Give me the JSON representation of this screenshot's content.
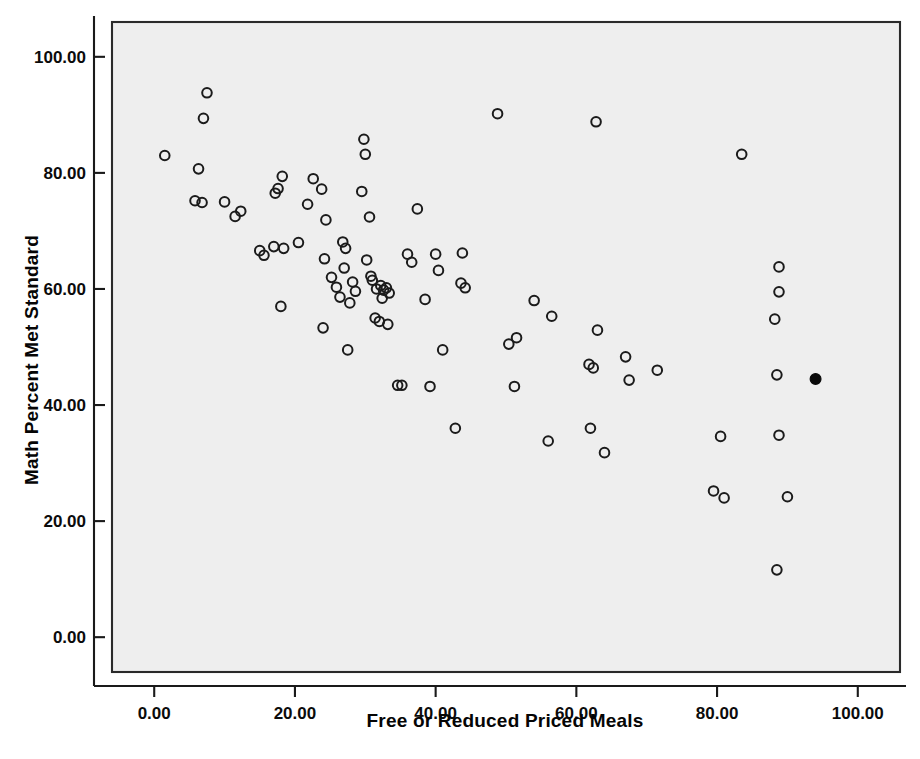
{
  "chart_data": {
    "type": "scatter",
    "title": "",
    "xlabel": "Free or Reduced Priced Meals",
    "ylabel": "Math Percent Met Standard",
    "xlim": [
      -6,
      106
    ],
    "ylim": [
      -6,
      106
    ],
    "xticks": [
      0,
      20,
      40,
      60,
      80,
      100
    ],
    "yticks": [
      0,
      20,
      40,
      60,
      80,
      100
    ],
    "xticklabels": [
      "0.00",
      "20.00",
      "40.00",
      "60.00",
      "80.00",
      "100.00"
    ],
    "yticklabels": [
      "0.00",
      "20.00",
      "40.00",
      "60.00",
      "80.00",
      "100.00"
    ],
    "grid": false,
    "legend": null,
    "marker": "circle-open",
    "marker_size": 9,
    "plot_background": "#eeeeee",
    "marker_color": "#1b1b1b",
    "highlight_color": "#0a0a0a",
    "series": [
      {
        "name": "Schools",
        "marker_style": "open",
        "points": [
          [
            1.5,
            83.0
          ],
          [
            7.5,
            93.8
          ],
          [
            7.0,
            89.4
          ],
          [
            6.3,
            80.7
          ],
          [
            5.8,
            75.2
          ],
          [
            6.8,
            74.9
          ],
          [
            10.0,
            75.0
          ],
          [
            11.5,
            72.5
          ],
          [
            12.3,
            73.4
          ],
          [
            15.0,
            66.6
          ],
          [
            15.6,
            65.8
          ],
          [
            17.2,
            76.5
          ],
          [
            17.6,
            77.3
          ],
          [
            18.2,
            79.4
          ],
          [
            17.0,
            67.3
          ],
          [
            18.4,
            67.0
          ],
          [
            18.0,
            57.0
          ],
          [
            20.5,
            68.0
          ],
          [
            21.8,
            74.6
          ],
          [
            22.6,
            79.0
          ],
          [
            23.8,
            77.2
          ],
          [
            24.4,
            71.9
          ],
          [
            24.2,
            65.2
          ],
          [
            24.0,
            53.3
          ],
          [
            25.2,
            62.0
          ],
          [
            25.9,
            60.3
          ],
          [
            26.4,
            58.6
          ],
          [
            26.8,
            68.1
          ],
          [
            27.2,
            67.0
          ],
          [
            27.0,
            63.6
          ],
          [
            27.8,
            57.6
          ],
          [
            28.2,
            61.2
          ],
          [
            28.6,
            59.6
          ],
          [
            27.5,
            49.5
          ],
          [
            29.5,
            76.8
          ],
          [
            29.8,
            85.8
          ],
          [
            30.0,
            83.2
          ],
          [
            30.6,
            72.4
          ],
          [
            30.2,
            65.0
          ],
          [
            30.8,
            62.2
          ],
          [
            31.0,
            61.5
          ],
          [
            31.6,
            60.0
          ],
          [
            31.4,
            55.0
          ],
          [
            32.2,
            60.6
          ],
          [
            32.6,
            59.8
          ],
          [
            32.4,
            58.4
          ],
          [
            33.0,
            60.2
          ],
          [
            33.4,
            59.3
          ],
          [
            32.0,
            54.4
          ],
          [
            33.2,
            53.9
          ],
          [
            34.6,
            43.4
          ],
          [
            35.2,
            43.4
          ],
          [
            36.0,
            66.0
          ],
          [
            36.6,
            64.6
          ],
          [
            37.4,
            73.8
          ],
          [
            38.5,
            58.2
          ],
          [
            39.2,
            43.2
          ],
          [
            40.0,
            66.0
          ],
          [
            40.4,
            63.2
          ],
          [
            41.0,
            49.5
          ],
          [
            42.8,
            36.0
          ],
          [
            43.6,
            61.0
          ],
          [
            44.2,
            60.2
          ],
          [
            43.8,
            66.2
          ],
          [
            48.8,
            90.2
          ],
          [
            50.4,
            50.5
          ],
          [
            51.5,
            51.6
          ],
          [
            51.2,
            43.2
          ],
          [
            54.0,
            58.0
          ],
          [
            56.0,
            33.8
          ],
          [
            56.5,
            55.3
          ],
          [
            62.8,
            88.8
          ],
          [
            61.8,
            47.0
          ],
          [
            62.4,
            46.4
          ],
          [
            62.0,
            36.0
          ],
          [
            63.0,
            52.9
          ],
          [
            64.0,
            31.8
          ],
          [
            67.0,
            48.3
          ],
          [
            67.5,
            44.3
          ],
          [
            71.5,
            46.0
          ],
          [
            79.5,
            25.2
          ],
          [
            81.0,
            24.0
          ],
          [
            80.5,
            34.6
          ],
          [
            83.5,
            83.2
          ],
          [
            88.8,
            63.8
          ],
          [
            88.8,
            59.5
          ],
          [
            88.2,
            54.8
          ],
          [
            88.5,
            45.2
          ],
          [
            88.8,
            34.8
          ],
          [
            90.0,
            24.2
          ],
          [
            88.5,
            11.6
          ]
        ]
      },
      {
        "name": "Highlighted School",
        "marker_style": "filled",
        "points": [
          [
            94.0,
            44.5
          ]
        ]
      }
    ]
  },
  "axes": {
    "x_title": "Free or Reduced Priced Meals",
    "y_title": "Math Percent Met Standard"
  }
}
